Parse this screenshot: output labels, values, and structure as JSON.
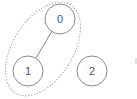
{
  "diagram": {
    "type": "graph",
    "nodes": [
      {
        "id": "0",
        "label": "0"
      },
      {
        "id": "1",
        "label": "1"
      },
      {
        "id": "2",
        "label": "2"
      }
    ],
    "edges": [
      {
        "from": "0",
        "to": "1"
      }
    ],
    "groups": [
      {
        "members": [
          "0",
          "1"
        ],
        "style": "dashed-ellipse"
      }
    ]
  },
  "colors": {
    "node_stroke": "#8a8a8a",
    "node_text": "#555555",
    "group_stroke": "#a8a8a8",
    "background": "#ffffff"
  }
}
